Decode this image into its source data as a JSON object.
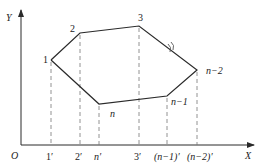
{
  "axes": {
    "origin_label": "O",
    "x_label": "X",
    "y_label": "Y"
  },
  "colors": {
    "line": "#2a2a2a",
    "dash": "#777777",
    "text": "#222222",
    "background": "#ffffff"
  },
  "vertices": [
    {
      "id": "1",
      "label": "1",
      "x": 51,
      "y": 60,
      "proj_label": "1′"
    },
    {
      "id": "2",
      "label": "2",
      "x": 80,
      "y": 33,
      "proj_label": "2′"
    },
    {
      "id": "3",
      "label": "3",
      "x": 139,
      "y": 26,
      "proj_label": "3′"
    },
    {
      "id": "n-2",
      "label": "n−2",
      "x": 197,
      "y": 70,
      "proj_label": "(n−2)′"
    },
    {
      "id": "n-1",
      "label": "n−1",
      "x": 167,
      "y": 96,
      "proj_label": "(n−1)′"
    },
    {
      "id": "n",
      "label": "n",
      "x": 99,
      "y": 104,
      "proj_label": "n′"
    }
  ],
  "break_symbol": "≈",
  "polygon_order": [
    "1",
    "2",
    "3",
    "n-2",
    "n-1",
    "n",
    "1"
  ],
  "labels": {
    "v1": "1",
    "v2": "2",
    "v3": "3",
    "vn2": "n−2",
    "vn1": "n−1",
    "vn": "n",
    "p1": "1′",
    "p2": "2′",
    "pn": "n′",
    "p3": "3′",
    "pn1": "(n−1)′",
    "pn2": "(n−2)′"
  }
}
